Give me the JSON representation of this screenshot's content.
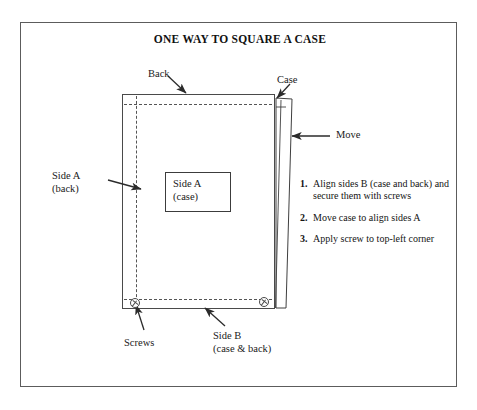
{
  "figure": {
    "title": "ONE WAY TO SQUARE A CASE",
    "labels": {
      "back": "Back",
      "case": "Case",
      "move": "Move",
      "side_a_back_line1": "Side A",
      "side_a_back_line2": "(back)",
      "side_a_case_line1": "Side A",
      "side_a_case_line2": "(case)",
      "screws": "Screws",
      "side_b_line1": "Side B",
      "side_b_line2": "(case & back)"
    },
    "steps": [
      {
        "num": "1.",
        "text": "Align sides B (case and back) and secure them with screws"
      },
      {
        "num": "2.",
        "text": "Move case to align sides A"
      },
      {
        "num": "3.",
        "text": "Apply screw to top-left corner"
      }
    ],
    "colors": {
      "frame_border": "#5c5c5c",
      "line": "#4a4a4a",
      "stipple": "#6e6e6e",
      "text": "#1a1a1a",
      "background": "#ffffff"
    }
  }
}
